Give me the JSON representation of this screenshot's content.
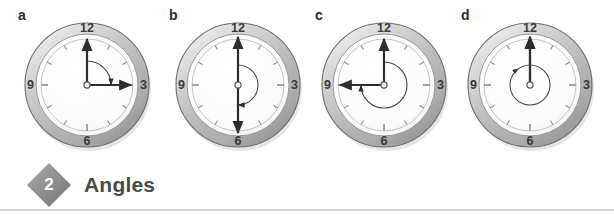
{
  "page": {
    "background_color": "#ffffff",
    "width": 614,
    "height": 214
  },
  "clocks": {
    "numerals": [
      "12",
      "3",
      "6",
      "9"
    ],
    "bezel_color": "#b9b9b9",
    "face_color": "#f7f7f7",
    "hand_color": "#2e2e2e",
    "items": [
      {
        "label": "a",
        "center_x": 87,
        "center_y": 85,
        "radius": 62,
        "hands": [
          {
            "name": "minute-hand",
            "points_to": "12",
            "angle_deg": 0,
            "length": 46
          },
          {
            "name": "hour-hand",
            "points_to": "3",
            "angle_deg": 90,
            "length": 44
          }
        ],
        "arc": {
          "from_deg": 0,
          "to_deg": 90,
          "sweep_deg": 90,
          "radius": 24,
          "direction": "clockwise",
          "arrow_at": "end"
        }
      },
      {
        "label": "b",
        "center_x": 238,
        "center_y": 85,
        "radius": 62,
        "hands": [
          {
            "name": "minute-hand",
            "points_to": "12",
            "angle_deg": 0,
            "length": 48
          },
          {
            "name": "hour-hand",
            "points_to": "6",
            "angle_deg": 180,
            "length": 48
          }
        ],
        "arc": {
          "from_deg": 0,
          "to_deg": 180,
          "sweep_deg": 180,
          "radius": 20,
          "direction": "clockwise",
          "arrow_at": "end"
        }
      },
      {
        "label": "c",
        "center_x": 384,
        "center_y": 85,
        "radius": 62,
        "hands": [
          {
            "name": "minute-hand",
            "points_to": "12",
            "angle_deg": 0,
            "length": 46
          },
          {
            "name": "hour-hand",
            "points_to": "9",
            "angle_deg": 270,
            "length": 44
          }
        ],
        "arc": {
          "from_deg": 0,
          "to_deg": 270,
          "sweep_deg": 270,
          "radius": 23,
          "direction": "clockwise",
          "arrow_at": "end"
        }
      },
      {
        "label": "d",
        "center_x": 530,
        "center_y": 85,
        "radius": 62,
        "hands": [
          {
            "name": "minute-hand",
            "points_to": "12",
            "angle_deg": 0,
            "length": 48
          },
          {
            "name": "hour-hand",
            "points_to": "12",
            "angle_deg": 0,
            "length": 48
          }
        ],
        "arc": {
          "from_deg": 0,
          "to_deg": 360,
          "sweep_deg": 360,
          "radius": 20,
          "direction": "clockwise",
          "arrow_at": "end"
        }
      }
    ]
  },
  "section": {
    "badge_number": "2",
    "badge_color": "#8d8d8d",
    "title": "Angles",
    "title_color": "#4a4a4a",
    "rule_color": "#d2d2d2"
  }
}
